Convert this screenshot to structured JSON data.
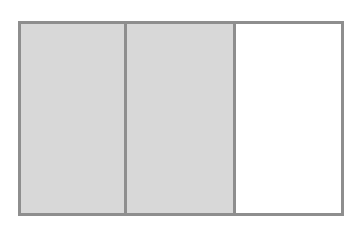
{
  "diagram": {
    "type": "fraction-bar",
    "total_parts": 3,
    "shaded_parts": 2,
    "fraction": "2/3",
    "colors": {
      "border": "#8e8e8e",
      "shaded": "#d8d8d8",
      "unshaded": "#ffffff",
      "background": "#ffffff"
    },
    "cells": [
      {
        "index": 1,
        "shaded": true,
        "width_px": 107
      },
      {
        "index": 2,
        "shaded": true,
        "width_px": 110
      },
      {
        "index": 3,
        "shaded": false,
        "width_px": 109
      }
    ]
  }
}
